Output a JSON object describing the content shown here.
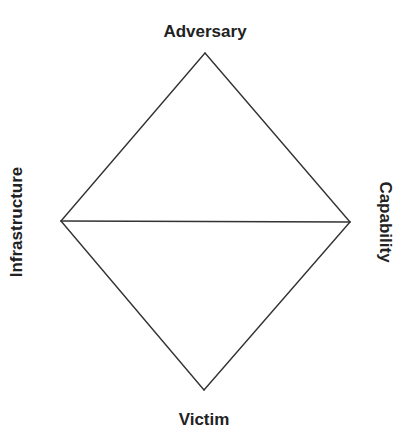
{
  "diagram": {
    "nodes": {
      "top": {
        "label": "Adversary",
        "x": 205,
        "y": 53
      },
      "right": {
        "label": "Capability",
        "x": 350,
        "y": 222
      },
      "bottom": {
        "label": "Victim",
        "x": 204,
        "y": 390
      },
      "left": {
        "label": "Infrastructure",
        "x": 61,
        "y": 221
      }
    },
    "edges": [
      {
        "from": "top",
        "to": "right"
      },
      {
        "from": "right",
        "to": "bottom"
      },
      {
        "from": "bottom",
        "to": "left"
      },
      {
        "from": "left",
        "to": "top"
      },
      {
        "from": "left",
        "to": "right"
      }
    ],
    "colors": {
      "line": "#333333",
      "text": "#222222",
      "background": "#ffffff"
    }
  }
}
